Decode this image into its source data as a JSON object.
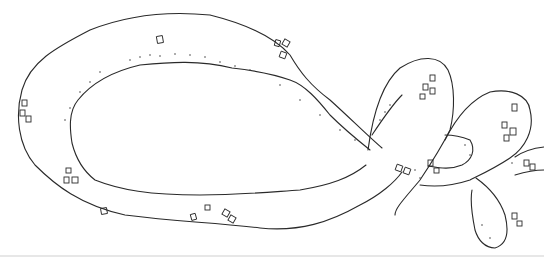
{
  "image": {
    "subject": "Hand-drawn pen illustration of a pretzel-shaped knot",
    "width": 544,
    "height": 258,
    "background_color": "#ffffff",
    "ink_color": "#2a2a2a"
  },
  "elements": {
    "main_loop": "Large elongated oval loop on the left",
    "right_loops": "Two small looping coils on the right with crossing strand",
    "salt_crystals": "Scattered small square salt crystal marks",
    "shading": "Stippled dot shading along inner edges"
  }
}
